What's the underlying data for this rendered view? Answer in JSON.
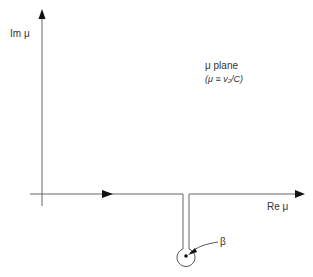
{
  "diagram": {
    "axes": {
      "imag_label": "Im μ",
      "real_label": "Re μ"
    },
    "plane_title": "μ plane",
    "plane_definition": "(μ ≡ v₂/C)",
    "point_label": "β",
    "colors": {
      "line": "#555555",
      "arrow": "#111111",
      "text": "#333333"
    }
  }
}
